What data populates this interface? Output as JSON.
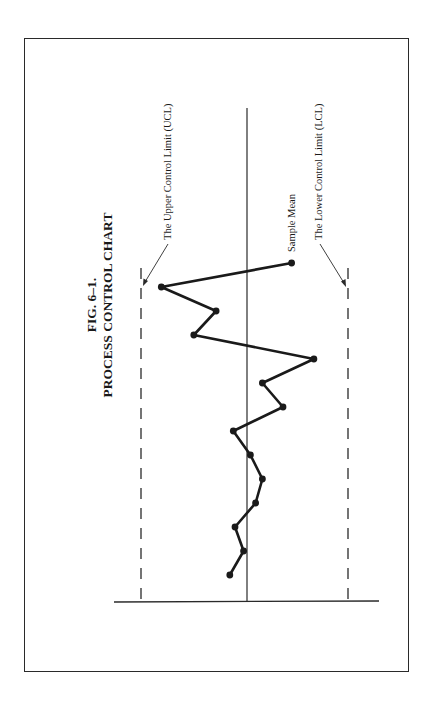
{
  "figure": {
    "number": "FIG. 6–1.",
    "title": "PROCESS CONTROL CHART"
  },
  "labels": {
    "ucl": "The Upper Control Limit (UCL)",
    "mean": "Sample Mean",
    "lcl": "The Lower Control Limit (LCL)"
  },
  "colors": {
    "ink": "#1a1a1a",
    "frame": "#2a2a2a",
    "background": "#ffffff"
  },
  "chart_data": {
    "type": "line",
    "title": "PROCESS CONTROL CHART",
    "subtitle": "FIG. 6–1.",
    "orientation": "rotated 90° counter-clockwise on page",
    "xlabel": "",
    "ylabel": "",
    "x": [
      1,
      2,
      3,
      4,
      5,
      6,
      7,
      8,
      9,
      10,
      11,
      12,
      13,
      14
    ],
    "series": [
      {
        "name": "Sample values",
        "values": [
          0.5,
          0.1,
          0.35,
          -0.25,
          -0.45,
          -0.1,
          0.4,
          -1.05,
          -0.45,
          -1.95,
          1.55,
          0.9,
          2.5,
          -1.3
        ],
        "markers": true
      }
    ],
    "reference_lines": [
      {
        "name": "The Upper Control Limit (UCL)",
        "value": 3,
        "style": "dashed"
      },
      {
        "name": "Sample Mean",
        "value": 0,
        "style": "solid"
      },
      {
        "name": "The Lower Control Limit (LCL)",
        "value": -3,
        "style": "dashed"
      }
    ],
    "ylim": [
      -3.8,
      3.8
    ],
    "grid": false,
    "legend": "none (direct labels with leader arrows)"
  }
}
